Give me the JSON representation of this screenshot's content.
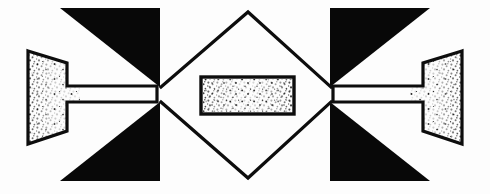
{
  "figure": {
    "canvas": {
      "width": 490,
      "height": 194
    },
    "background_color": "#fdfdfd",
    "ink_color": "#0d0d0d",
    "solid_fill_color": "#080808",
    "stipple_dot_color": "#111111",
    "line_width": 3.2
  },
  "shapes": {
    "left_horn": {
      "name": "left-stippled-horn",
      "fill": "stipple",
      "points": "27,50 68,62 68,86 160,88 160,88 68,88 68,88 68,62",
      "outline_points": "27,50 68,63 68,87 159,87 159,101 68,101 68,131 27,145",
      "stipple_band": {
        "x": 28,
        "y": 51,
        "width": 26,
        "height": 93
      }
    },
    "right_horn": {
      "name": "right-stippled-horn",
      "outline_points": "463,50 422,63 422,87 331,87 331,101 422,101 422,131 463,145",
      "stipple_band": {
        "x": 436,
        "y": 51,
        "width": 26,
        "height": 93
      }
    },
    "triangle_top_left": {
      "name": "solid-triangle-top-left",
      "points": "60,8 160,8 160,87"
    },
    "triangle_bottom_left": {
      "name": "solid-triangle-bottom-left",
      "points": "60,181 160,181 160,102"
    },
    "triangle_top_right": {
      "name": "solid-triangle-top-right",
      "points": "430,8 330,8 330,87"
    },
    "triangle_bottom_right": {
      "name": "solid-triangle-bottom-right",
      "points": "430,181 330,181 330,102"
    },
    "center_diamond": {
      "name": "center-diamond-outline",
      "points": "162,88 248,12 329,88 329,101 248,178 162,101"
    },
    "center_rectangle": {
      "name": "center-stippled-rectangle",
      "x": 201,
      "y": 77,
      "width": 93,
      "height": 37
    }
  },
  "legend": {
    "solid_black_label": "solid black region",
    "stipple_label": "stippled (granular) region",
    "outline_label": "line outline"
  }
}
